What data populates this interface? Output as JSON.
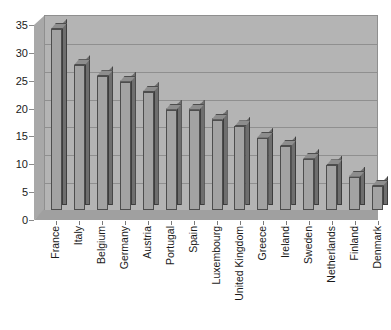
{
  "chart_data": {
    "type": "bar",
    "title": "",
    "subtitle": "",
    "xlabel": "",
    "ylabel": "",
    "ylim": [
      0,
      35
    ],
    "y_ticks": [
      0,
      5,
      10,
      15,
      20,
      25,
      30,
      35
    ],
    "grid": true,
    "legend": "none",
    "style": "3d-grayscale-column",
    "categories": [
      "France",
      "Italy",
      "Belgium",
      "Germany",
      "Austria",
      "Portugal",
      "Spain",
      "Luxembourg",
      "United Kingdom",
      "Greece",
      "Ireland",
      "Sweden",
      "Netherlands",
      "Finland",
      "Denmark"
    ],
    "values": [
      32.5,
      26,
      24,
      23,
      21.2,
      18,
      18,
      16.2,
      15,
      13,
      11.5,
      9.2,
      8,
      6,
      4.3
    ]
  },
  "colors": {
    "bar_front": "#a3a3a3",
    "bar_side": "#6e6e6e",
    "bar_top": "#8d8d8d",
    "bar_outline": "#4d4d4d",
    "back_wall": "#b4b4b4",
    "side_wall": "#a8a8a8",
    "floor": "#a0a0a0",
    "gridline": "#8f8f8f",
    "text": "#1a1a1a",
    "background": "#ffffff"
  }
}
